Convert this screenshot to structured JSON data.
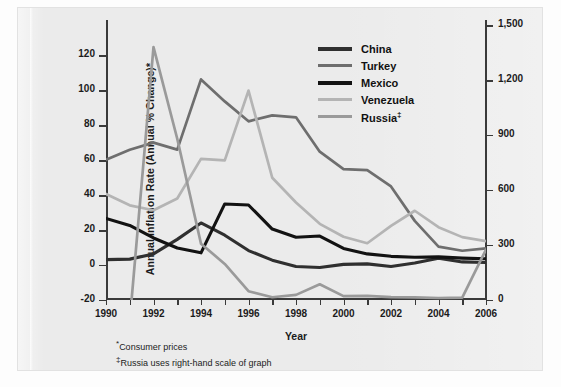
{
  "axes": {
    "ylabel_left": "Annual Inflation Rate (Annual % Change)*",
    "xlabel": "Year",
    "yticks_left": [
      "-20",
      "0",
      "20",
      "40",
      "60",
      "80",
      "100",
      "120"
    ],
    "yticks_right": [
      "0",
      "300",
      "600",
      "900",
      "1,200",
      "1,500"
    ],
    "xticks": [
      "1990",
      "1992",
      "1994",
      "1996",
      "1998",
      "2000",
      "2002",
      "2004",
      "2006"
    ]
  },
  "legend": {
    "items": [
      {
        "label": "China",
        "color": "#2f2f2f"
      },
      {
        "label": "Turkey",
        "color": "#6e6e6e"
      },
      {
        "label": "Mexico",
        "color": "#121212"
      },
      {
        "label": "Venezuela",
        "color": "#b4b4b4"
      },
      {
        "label": "Russia",
        "marker": "‡",
        "color": "#9a9a9a"
      }
    ]
  },
  "notes": {
    "note1_marker": "*",
    "note1": "Consumer prices",
    "note2_marker": "‡",
    "note2": "Russia uses right-hand scale of graph"
  },
  "chart_data": {
    "type": "line",
    "title": "",
    "xlabel": "Year",
    "ylabel": "Annual Inflation Rate (Annual % Change)*",
    "x": [
      1990,
      1991,
      1992,
      1993,
      1994,
      1995,
      1996,
      1997,
      1998,
      1999,
      2000,
      2001,
      2002,
      2003,
      2004,
      2005,
      2006
    ],
    "xlim": [
      1990,
      2006
    ],
    "ylim": [
      -20,
      130
    ],
    "ylim_right": [
      0,
      1430
    ],
    "grid": false,
    "legend_position": "top-right",
    "series": [
      {
        "name": "China",
        "axis": "left",
        "color": "#2f2f2f",
        "values": [
          3.1,
          3.4,
          6.4,
          14.7,
          24.1,
          17.1,
          8.3,
          2.8,
          -0.8,
          -1.4,
          0.4,
          0.7,
          -0.8,
          1.2,
          3.9,
          1.8,
          1.5
        ]
      },
      {
        "name": "Turkey",
        "axis": "left",
        "color": "#6e6e6e",
        "values": [
          60.3,
          66.0,
          70.1,
          66.1,
          106.3,
          93.7,
          82.3,
          85.7,
          84.6,
          64.9,
          54.9,
          54.4,
          45.0,
          25.3,
          10.6,
          8.2,
          9.6
        ]
      },
      {
        "name": "Mexico",
        "axis": "left",
        "color": "#121212",
        "values": [
          26.7,
          22.7,
          15.5,
          9.8,
          7.0,
          35.0,
          34.4,
          20.6,
          15.9,
          16.6,
          9.5,
          6.4,
          5.0,
          4.5,
          4.7,
          4.0,
          3.6
        ]
      },
      {
        "name": "Venezuela",
        "axis": "left",
        "color": "#b4b4b4",
        "values": [
          40.7,
          34.2,
          31.4,
          38.1,
          60.8,
          59.9,
          99.9,
          50.0,
          35.8,
          23.6,
          16.2,
          12.5,
          22.4,
          31.1,
          21.7,
          16.0,
          13.7
        ]
      },
      {
        "name": "Russia",
        "axis": "right",
        "color": "#9a9a9a",
        "note": "‡",
        "values": [
          null,
          -115,
          1380,
          880,
          307,
          197,
          48,
          15,
          28,
          86,
          21,
          22,
          16,
          14,
          11,
          13,
          275
        ]
      }
    ],
    "annotations": [
      "* Consumer prices",
      "‡ Russia uses right-hand scale of graph"
    ]
  }
}
